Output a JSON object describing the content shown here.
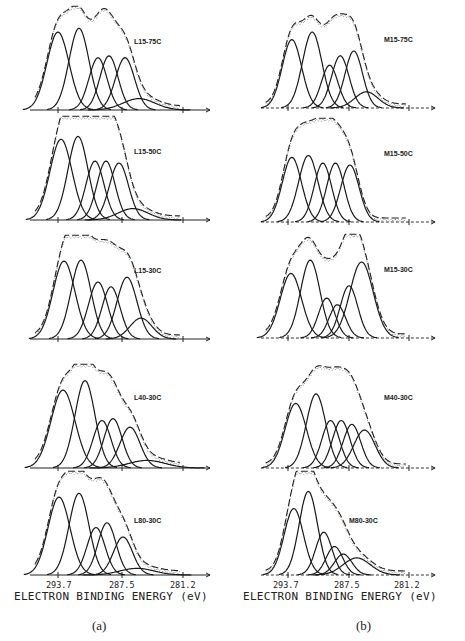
{
  "figure": {
    "captions": [
      "(a)",
      "(b)"
    ],
    "xlabel": "ELECTRON BINDING ENERGY (eV)",
    "ticks": [
      "293.7",
      "287.5",
      "281.2"
    ]
  },
  "chart_data": [
    {
      "type": "line",
      "title": "L15-75C",
      "panel": "a",
      "xlabel": "ELECTRON BINDING ENERGY (eV)",
      "x_ticks": [
        293.7,
        287.5,
        281.2
      ],
      "xlim": [
        296,
        279
      ],
      "components": [
        {
          "center": 293.7,
          "height": 0.82,
          "width": 1.1
        },
        {
          "center": 291.6,
          "height": 0.86,
          "width": 1.0
        },
        {
          "center": 289.7,
          "height": 0.55,
          "width": 0.9
        },
        {
          "center": 288.6,
          "height": 0.57,
          "width": 0.9
        },
        {
          "center": 287.0,
          "height": 0.55,
          "width": 0.95
        },
        {
          "center": 285.6,
          "height": 0.12,
          "width": 1.6
        }
      ]
    },
    {
      "type": "line",
      "title": "L15-50C",
      "panel": "a",
      "xlim": [
        296,
        279
      ],
      "x_ticks": [
        293.7,
        287.5,
        281.2
      ],
      "components": [
        {
          "center": 293.4,
          "height": 0.85,
          "width": 1.1
        },
        {
          "center": 291.7,
          "height": 0.88,
          "width": 1.0
        },
        {
          "center": 290.0,
          "height": 0.62,
          "width": 0.9
        },
        {
          "center": 288.9,
          "height": 0.62,
          "width": 0.9
        },
        {
          "center": 287.6,
          "height": 0.6,
          "width": 0.95
        },
        {
          "center": 286.2,
          "height": 0.12,
          "width": 1.5
        }
      ]
    },
    {
      "type": "line",
      "title": "L15-30C",
      "panel": "a",
      "xlim": [
        296,
        279
      ],
      "x_ticks": [
        293.7,
        287.5,
        281.2
      ],
      "components": [
        {
          "center": 293.1,
          "height": 0.82,
          "width": 1.1
        },
        {
          "center": 291.4,
          "height": 0.83,
          "width": 1.0
        },
        {
          "center": 289.7,
          "height": 0.6,
          "width": 0.95
        },
        {
          "center": 288.4,
          "height": 0.55,
          "width": 0.9
        },
        {
          "center": 286.8,
          "height": 0.65,
          "width": 1.0
        },
        {
          "center": 285.4,
          "height": 0.22,
          "width": 1.1
        }
      ]
    },
    {
      "type": "line",
      "title": "L40-30C",
      "panel": "a",
      "xlim": [
        296,
        279
      ],
      "x_ticks": [
        293.7,
        287.5,
        281.2
      ],
      "components": [
        {
          "center": 293.2,
          "height": 0.82,
          "width": 1.2
        },
        {
          "center": 291.0,
          "height": 0.92,
          "width": 1.0
        },
        {
          "center": 289.3,
          "height": 0.5,
          "width": 0.9
        },
        {
          "center": 288.2,
          "height": 0.52,
          "width": 0.9
        },
        {
          "center": 286.5,
          "height": 0.43,
          "width": 1.0
        },
        {
          "center": 284.8,
          "height": 0.08,
          "width": 1.8
        }
      ]
    },
    {
      "type": "line",
      "title": "L80-30C",
      "panel": "a",
      "xlim": [
        296,
        279
      ],
      "x_ticks": [
        293.7,
        287.5,
        281.2
      ],
      "components": [
        {
          "center": 293.6,
          "height": 0.82,
          "width": 1.1
        },
        {
          "center": 291.6,
          "height": 0.86,
          "width": 1.0
        },
        {
          "center": 289.9,
          "height": 0.5,
          "width": 0.9
        },
        {
          "center": 288.8,
          "height": 0.55,
          "width": 0.9
        },
        {
          "center": 287.2,
          "height": 0.4,
          "width": 0.95
        },
        {
          "center": 285.8,
          "height": 0.07,
          "width": 1.7
        }
      ]
    },
    {
      "type": "line",
      "title": "M15-75C",
      "panel": "b",
      "xlim": [
        296,
        279
      ],
      "x_ticks": [
        293.7,
        287.5,
        281.2
      ],
      "components": [
        {
          "center": 293.3,
          "height": 0.72,
          "width": 1.0
        },
        {
          "center": 291.2,
          "height": 0.8,
          "width": 1.0
        },
        {
          "center": 289.4,
          "height": 0.45,
          "width": 0.85
        },
        {
          "center": 288.3,
          "height": 0.55,
          "width": 0.9
        },
        {
          "center": 286.9,
          "height": 0.6,
          "width": 0.9
        },
        {
          "center": 285.6,
          "height": 0.17,
          "width": 1.2
        }
      ]
    },
    {
      "type": "line",
      "title": "M15-50C",
      "panel": "b",
      "xlim": [
        296,
        279
      ],
      "x_ticks": [
        293.7,
        287.5,
        281.2
      ],
      "components": [
        {
          "center": 293.3,
          "height": 0.68,
          "width": 1.0
        },
        {
          "center": 291.6,
          "height": 0.7,
          "width": 1.0
        },
        {
          "center": 290.1,
          "height": 0.62,
          "width": 0.9
        },
        {
          "center": 288.8,
          "height": 0.62,
          "width": 0.9
        },
        {
          "center": 287.3,
          "height": 0.6,
          "width": 0.95
        }
      ]
    },
    {
      "type": "line",
      "title": "M15-30C",
      "panel": "b",
      "xlim": [
        296,
        279
      ],
      "x_ticks": [
        293.7,
        287.5,
        281.2
      ],
      "components": [
        {
          "center": 293.4,
          "height": 0.68,
          "width": 1.1
        },
        {
          "center": 291.4,
          "height": 0.82,
          "width": 1.0
        },
        {
          "center": 289.7,
          "height": 0.42,
          "width": 0.85
        },
        {
          "center": 288.6,
          "height": 0.35,
          "width": 0.85
        },
        {
          "center": 287.4,
          "height": 0.55,
          "width": 0.9
        },
        {
          "center": 286.1,
          "height": 0.8,
          "width": 1.2
        }
      ]
    },
    {
      "type": "line",
      "title": "M40-30C",
      "panel": "b",
      "xlim": [
        296,
        279
      ],
      "x_ticks": [
        293.7,
        287.5,
        281.2
      ],
      "components": [
        {
          "center": 292.9,
          "height": 0.68,
          "width": 1.1
        },
        {
          "center": 290.8,
          "height": 0.78,
          "width": 1.0
        },
        {
          "center": 289.3,
          "height": 0.5,
          "width": 0.9
        },
        {
          "center": 288.2,
          "height": 0.5,
          "width": 0.9
        },
        {
          "center": 287.1,
          "height": 0.46,
          "width": 0.9
        },
        {
          "center": 285.8,
          "height": 0.4,
          "width": 1.1
        }
      ]
    },
    {
      "type": "line",
      "title": "M80-30C",
      "panel": "b",
      "xlim": [
        296,
        279
      ],
      "x_ticks": [
        293.7,
        287.5,
        281.2
      ],
      "components": [
        {
          "center": 293.1,
          "height": 0.7,
          "width": 1.0
        },
        {
          "center": 291.6,
          "height": 0.88,
          "width": 0.95
        },
        {
          "center": 290.0,
          "height": 0.45,
          "width": 0.85
        },
        {
          "center": 288.9,
          "height": 0.3,
          "width": 0.85
        },
        {
          "center": 288.0,
          "height": 0.22,
          "width": 0.9
        },
        {
          "center": 286.6,
          "height": 0.18,
          "width": 1.4
        }
      ]
    }
  ],
  "layout": {
    "panel_a": {
      "axis_x0": 22,
      "axis_x1": 182,
      "tick_px": [
        58,
        122,
        183
      ]
    },
    "panel_b": {
      "axis_x0": 260,
      "axis_x1": 440,
      "tick_px": [
        288,
        349,
        409
      ]
    },
    "rows_baseline_y": [
      110,
      220,
      339,
      468,
      575
    ],
    "rows_b_baseline_y": [
      108,
      222,
      338,
      468,
      575
    ],
    "row_height_px": 95
  }
}
